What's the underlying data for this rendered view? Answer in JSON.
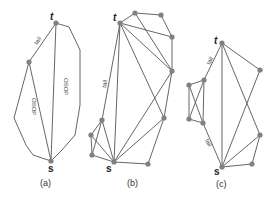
{
  "figure": {
    "panels": [
      {
        "id": "a",
        "caption": "(a)",
        "source_label": "s",
        "target_label": "t",
        "edge_labels": [
          "tail",
          "OSOP",
          "OSOP"
        ]
      },
      {
        "id": "b",
        "caption": "(b)",
        "source_label": "s",
        "target_label": "t",
        "edge_labels": [
          "tail"
        ]
      },
      {
        "id": "c",
        "caption": "(c)",
        "source_label": "s",
        "target_label": "t",
        "edge_labels": [
          "tail",
          "tail"
        ]
      }
    ],
    "colors": {
      "edge": "#555555",
      "node": "#808080",
      "text": "#222222"
    }
  }
}
